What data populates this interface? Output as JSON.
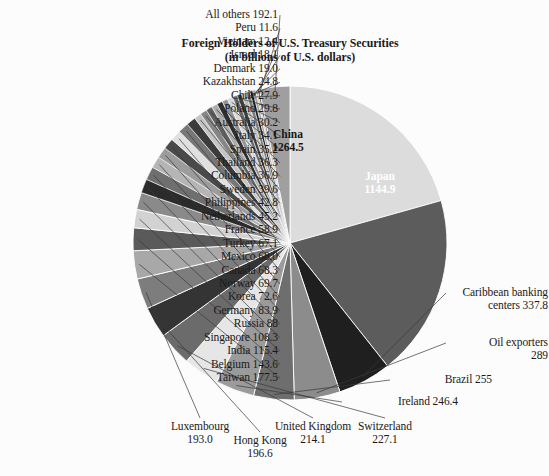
{
  "chart_data": {
    "type": "pie",
    "title": "Foreign Holders of U.S. Treasury Securities",
    "subtitle": "(in billions of U.S. dollars)",
    "units": "billions of U.S. dollars",
    "start_angle_deg": 0,
    "direction": "clockwise",
    "legend": "none-labels-attached",
    "categories": [
      "China",
      "Japan",
      "Caribbean banking centers",
      "Oil exporters",
      "Brazil",
      "Ireland",
      "Switzerland",
      "United Kingdom",
      "Hong Kong",
      "Luxembourg",
      "Taiwan",
      "Belgium",
      "India",
      "Singapore",
      "Russia",
      "Germany",
      "Korea",
      "Norway",
      "Canada",
      "Mexico",
      "Turkey",
      "France",
      "Netherlands",
      "Philippines",
      "Sweden",
      "Columbia",
      "Thailand",
      "Spain",
      "Italy",
      "Australia",
      "Poland",
      "Chile",
      "Kazakhstan",
      "Denmark",
      "Israel",
      "Vietnam",
      "Peru",
      "All others"
    ],
    "values": [
      1264.5,
      1144.9,
      337.8,
      289,
      255,
      246.4,
      227.1,
      214.1,
      196.6,
      193.0,
      177.5,
      143.6,
      115.4,
      108.3,
      88,
      83.9,
      72.6,
      69.7,
      68.3,
      68.0,
      67.1,
      58.9,
      45.2,
      42.8,
      39.6,
      36.9,
      36.3,
      35.2,
      34.1,
      30.2,
      29.8,
      27.9,
      24.8,
      19.0,
      18.1,
      12.4,
      11.6,
      192.1
    ],
    "colors": [
      "#dcdcdc",
      "#5c5c5c",
      "#1f1f1f",
      "#8c8c8c",
      "#6e6e6e",
      "#9b9b9b",
      "#e6e6e6",
      "#6b6b6b",
      "#343434",
      "#7d7d7d",
      "#a8a8a8",
      "#5a5a5a",
      "#d2d2d2",
      "#8a8a8a",
      "#2b2b2b",
      "#6f6f6f",
      "#b5b5b5",
      "#9c9c9c",
      "#4a4a4a",
      "#e0e0e0",
      "#777777",
      "#3c3c3c",
      "#c4c4c4",
      "#868686",
      "#5e5e5e",
      "#adadad",
      "#2f2f2f",
      "#949494",
      "#d8d8d8",
      "#6a6a6a",
      "#404040",
      "#bdbdbd",
      "#7b7b7b",
      "#1c1c1c",
      "#a3a3a3",
      "#cfcfcf",
      "#555555",
      "#9f9f9f"
    ],
    "separator_color": "#ffffff"
  },
  "title": {
    "line1": "Foreign Holders of U.S. Treasury Securities",
    "line2": "(in billions of U.S. dollars)"
  },
  "inside_labels": [
    {
      "name": "China",
      "value": "1264.5"
    },
    {
      "name": "Japan",
      "value": "1144.9"
    }
  ],
  "callout_labels": {
    "left": [
      {
        "text": "All others 192.1"
      },
      {
        "text": "Peru 11.6"
      },
      {
        "text": "Vietnam 12.4"
      },
      {
        "text": "Israel 18.1"
      },
      {
        "text": "Denmark 19.0"
      },
      {
        "text": "Kazakhstan 24.8"
      },
      {
        "text": "Chile 27.9"
      },
      {
        "text": "Poland 29.8"
      },
      {
        "text": "Australia 30.2"
      },
      {
        "text": "Italy 34.1"
      },
      {
        "text": "Spain 35.2"
      },
      {
        "text": "Thailand 36.3"
      },
      {
        "text": "Columbia 36.9"
      },
      {
        "text": "Sweden 39.6"
      },
      {
        "text": "Philippines 42.8"
      },
      {
        "text": "Netherlands 45.2"
      },
      {
        "text": "France 58.9"
      },
      {
        "text": "Turkey 67.1"
      },
      {
        "text": "Mexico 68.0"
      },
      {
        "text": "Canada 68.3"
      },
      {
        "text": "Norway 69.7"
      },
      {
        "text": "Korea 72.6"
      },
      {
        "text": "Germany 83.9"
      },
      {
        "text": "Russia 88"
      },
      {
        "text": "Singapore 108.3"
      },
      {
        "text": "India 115.4"
      },
      {
        "text": "Belgium 143.6"
      },
      {
        "text": "Taiwan 177.5"
      }
    ],
    "bottom": [
      {
        "line1": "Luxembourg",
        "line2": "193.0"
      },
      {
        "line1": "Hong Kong",
        "line2": "196.6"
      },
      {
        "line1": "United Kingdom",
        "line2": "214.1"
      },
      {
        "line1": "Switzerland",
        "line2": "227.1"
      }
    ],
    "right": [
      {
        "line1": "Caribbean banking",
        "line2": "centers 337.8"
      },
      {
        "line1": "Oil exporters",
        "line2": "289"
      },
      {
        "line1": "Brazil 255",
        "line2": ""
      },
      {
        "line1": "Ireland 246.4",
        "line2": ""
      }
    ]
  }
}
